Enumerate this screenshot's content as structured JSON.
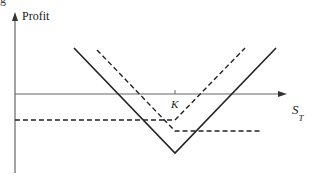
{
  "chart_data": {
    "type": "line",
    "title": "",
    "xlabel": "S_T",
    "xlabel_main": "S",
    "xlabel_sub": "T",
    "ylabel": "Profit",
    "x_ticks": [
      {
        "label": "K",
        "x": 175
      }
    ],
    "grid": false,
    "legend": null,
    "series": [
      {
        "name": "straddle-total",
        "style": "solid",
        "points": [
          [
            74,
            48
          ],
          [
            175,
            153
          ],
          [
            276,
            48
          ]
        ]
      },
      {
        "name": "long-call",
        "style": "dashed",
        "points": [
          [
            15,
            120
          ],
          [
            175,
            120
          ],
          [
            245,
            48
          ]
        ]
      },
      {
        "name": "long-put",
        "style": "dashed",
        "points": [
          [
            97,
            50
          ],
          [
            175,
            131
          ],
          [
            262,
            131
          ]
        ]
      }
    ],
    "axes": {
      "origin": [
        15,
        94
      ],
      "x_axis_end": 283,
      "y_axis_top": 18,
      "y_axis_bottom": 173
    }
  },
  "labels": {
    "ylabel": "Profit",
    "strike": "K",
    "xlabel_main": "S",
    "xlabel_sub": "T",
    "caption_fragment": "g"
  },
  "colors": {
    "axis": "#666666",
    "line": "#222222",
    "background": "#ffffff"
  }
}
